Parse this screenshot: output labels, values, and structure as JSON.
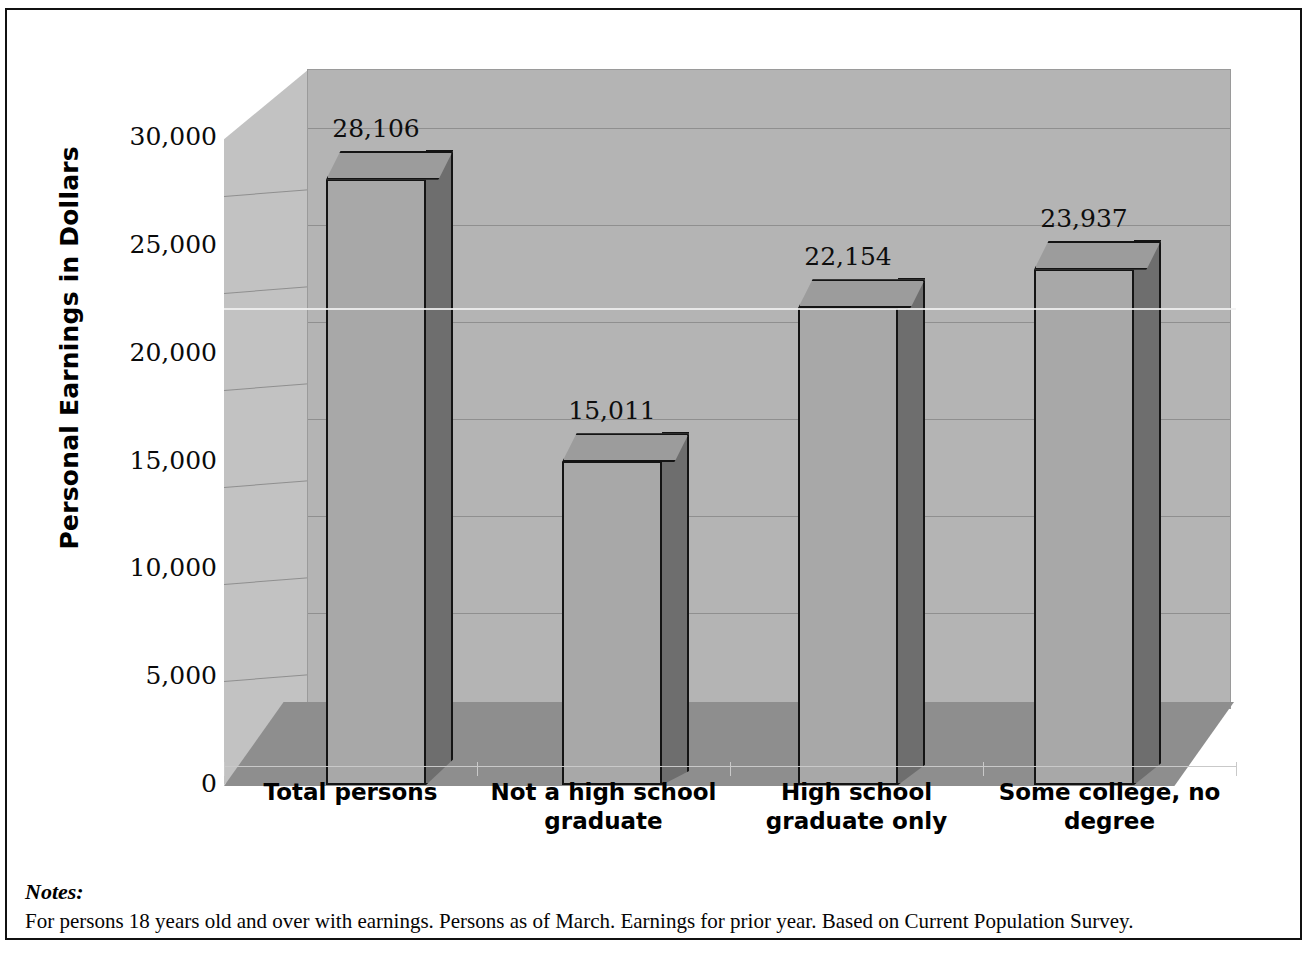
{
  "figure": {
    "y_axis_title": "Personal Earnings in Dollars",
    "notes_label": "Notes:",
    "notes_text": "For persons 18 years old and over with earnings. Persons as of March. Earnings for prior year. Based on Current Population Survey.",
    "bottom_bleed": ""
  },
  "chart_data": {
    "type": "bar",
    "title": "",
    "xlabel": "",
    "ylabel": "Personal Earnings in Dollars",
    "categories": [
      "Total persons",
      "Not a high school graduate",
      "High school graduate only",
      "Some college, no degree"
    ],
    "category_lines": [
      [
        "Total persons"
      ],
      [
        "Not a high school",
        "graduate"
      ],
      [
        "High school",
        "graduate only"
      ],
      [
        "Some college, no",
        "degree"
      ]
    ],
    "values": [
      28106,
      15011,
      22154,
      23937
    ],
    "value_labels": [
      "28,106",
      "15,011",
      "22,154",
      "23,937"
    ],
    "ylim": [
      0,
      30000
    ],
    "yticks": [
      0,
      5000,
      10000,
      15000,
      20000,
      25000,
      30000
    ],
    "ytick_labels": [
      "0",
      "5,000",
      "10,000",
      "15,000",
      "20,000",
      "25,000",
      "30,000"
    ],
    "grid": true,
    "legend": false,
    "style": "3d-column"
  },
  "colors": {
    "bar_front": "#a8a8a8",
    "bar_side": "#6e6e6e",
    "bar_top": "#9c9c9c",
    "bar_outline": "#141414",
    "back_wall": "#b4b4b4",
    "left_wall": "#c2c2c2",
    "floor": "#8e8e8e",
    "gridline": "#8f8f8f",
    "frame": "#111111",
    "text": "#000000"
  }
}
